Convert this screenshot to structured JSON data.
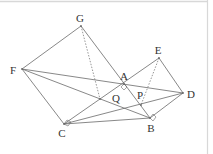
{
  "diagram": {
    "type": "geometry-figure",
    "colors": {
      "line": "#6a6a6a",
      "label": "#333333",
      "border": "#d8d8d8",
      "background": "#ffffff"
    },
    "points": [
      {
        "name": "F",
        "x": 22,
        "y": 69,
        "label": "F",
        "lx": 13,
        "ly": 70
      },
      {
        "name": "G",
        "x": 81,
        "y": 26,
        "label": "G",
        "lx": 80,
        "ly": 18
      },
      {
        "name": "A",
        "x": 124,
        "y": 84,
        "label": "A",
        "lx": 124,
        "ly": 76
      },
      {
        "name": "E",
        "x": 159,
        "y": 58,
        "label": "E",
        "lx": 158,
        "ly": 50
      },
      {
        "name": "D",
        "x": 183,
        "y": 93,
        "label": "D",
        "lx": 191,
        "ly": 94
      },
      {
        "name": "B",
        "x": 150,
        "y": 118,
        "label": "B",
        "lx": 151,
        "ly": 128
      },
      {
        "name": "C",
        "x": 64,
        "y": 124,
        "label": "C",
        "lx": 62,
        "ly": 133
      },
      {
        "name": "Q",
        "x": 100,
        "y": 99,
        "label": "Q",
        "lx": 116,
        "ly": 98
      },
      {
        "name": "P",
        "x": 141,
        "y": 105,
        "label": "P",
        "lx": 140,
        "ly": 95
      }
    ],
    "segments": [
      {
        "from": "F",
        "to": "G",
        "style": "solid"
      },
      {
        "from": "G",
        "to": "B",
        "style": "solid"
      },
      {
        "from": "F",
        "to": "C",
        "style": "solid"
      },
      {
        "from": "C",
        "to": "B",
        "style": "solid"
      },
      {
        "from": "B",
        "to": "D",
        "style": "solid"
      },
      {
        "from": "D",
        "to": "E",
        "style": "solid"
      },
      {
        "from": "E",
        "to": "C",
        "style": "solid"
      },
      {
        "from": "F",
        "to": "D",
        "style": "solid"
      },
      {
        "from": "F",
        "to": "B",
        "style": "solid"
      },
      {
        "from": "C",
        "to": "D",
        "style": "solid"
      },
      {
        "from": "G",
        "to": "Q",
        "style": "dotted"
      },
      {
        "from": "E",
        "to": "P",
        "style": "dotted"
      }
    ],
    "right_angles": [
      "A",
      "C",
      "B"
    ]
  }
}
